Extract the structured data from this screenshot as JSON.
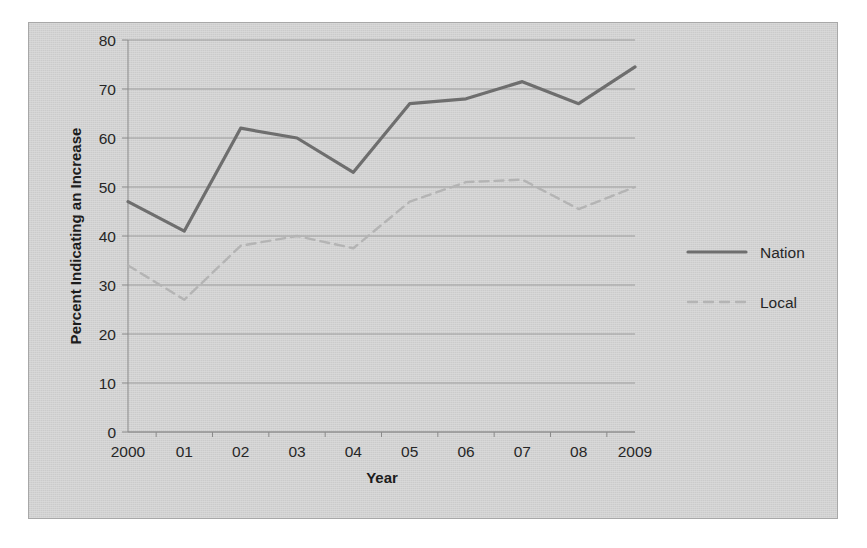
{
  "figure": {
    "panel_background": "#d2d2d2",
    "panel_border": "#a8a8a8",
    "page_background": "#ffffff"
  },
  "chart_data": {
    "type": "line",
    "title": "",
    "xlabel": "Year",
    "ylabel": "Percent Indicating an Increase",
    "categories": [
      "2000",
      "01",
      "02",
      "03",
      "04",
      "05",
      "06",
      "07",
      "08",
      "2009"
    ],
    "x": [
      2000,
      2001,
      2002,
      2003,
      2004,
      2005,
      2006,
      2007,
      2008,
      2009
    ],
    "ylim": [
      0,
      80
    ],
    "yticks": [
      0,
      10,
      20,
      30,
      40,
      50,
      60,
      70,
      80
    ],
    "ytick_labels": [
      "0",
      "10",
      "20",
      "30",
      "40",
      "50",
      "60",
      "70",
      "80"
    ],
    "grid": true,
    "grid_axis": "y",
    "legend_position": "right",
    "series": [
      {
        "name": "Nation",
        "style": "solid",
        "color": "#6e6e6e",
        "width": 3.2,
        "values": [
          47,
          41,
          62,
          60,
          53,
          67,
          68,
          71.5,
          67,
          74.5
        ]
      },
      {
        "name": "Local",
        "style": "dashed",
        "color": "#b4b4b4",
        "width": 2.4,
        "values": [
          34,
          27,
          38,
          40,
          37.5,
          47,
          51,
          51.5,
          45.5,
          50
        ]
      }
    ]
  },
  "legend": {
    "entries": [
      {
        "label": "Nation",
        "color": "#6e6e6e",
        "style": "solid"
      },
      {
        "label": "Local",
        "color": "#b4b4b4",
        "style": "dashed"
      }
    ]
  }
}
